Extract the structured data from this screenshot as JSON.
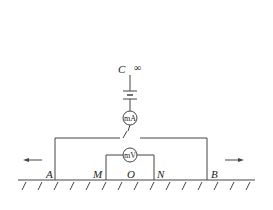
{
  "diagram": {
    "type": "circuit-schematic",
    "labels": {
      "C": "C",
      "infinity": "∞",
      "A": "A",
      "M": "M",
      "O": "O",
      "N": "N",
      "B": "B"
    },
    "meters": {
      "ammeter": "mA",
      "voltmeter": "mV"
    },
    "components": [
      "battery",
      "ammeter",
      "switch",
      "voltmeter",
      "ground",
      "left-arrow",
      "right-arrow"
    ],
    "colors": {
      "line": "#444444",
      "text": "#222222",
      "background": "#ffffff"
    }
  }
}
